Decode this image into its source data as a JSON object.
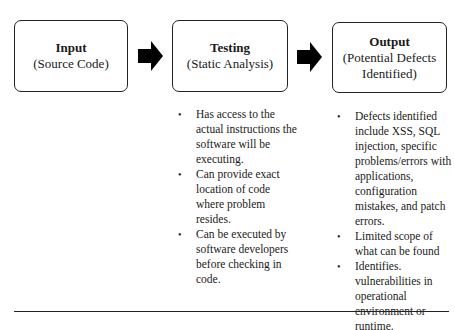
{
  "boxes": [
    {
      "title": "Input",
      "subtitle": "(Source Code)"
    },
    {
      "title": "Testing",
      "subtitle": "(Static Analysis)"
    },
    {
      "title": "Output",
      "subtitle": "(Potential Defects Identified)"
    }
  ],
  "testing_bullets": [
    "Has access to the actual instructions the software will be executing.",
    "Can provide exact location of code where problem resides.",
    "Can be executed by software developers before checking in code."
  ],
  "output_bullets": [
    "Defects identified include XSS, SQL injection, specific problems/errors with applications, configuration mistakes, and patch errors.",
    "Limited scope of what can be found",
    "Identifies. vulnerabilities in operational environment or runtime."
  ],
  "icons": {
    "flow_arrow": "right-block-arrow"
  }
}
